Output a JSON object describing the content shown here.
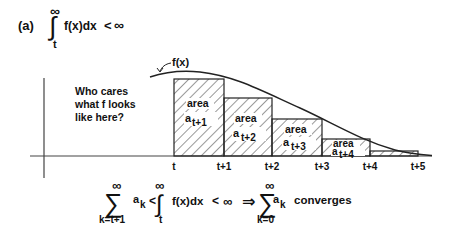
{
  "header": {
    "part_label": "(a)",
    "integral_upper": "∞",
    "integral_lower": "t",
    "integrand": "f(x)dx",
    "relation": "<",
    "bound": "∞"
  },
  "graph": {
    "curve_label": "f(x)",
    "note_lines": [
      "Who cares",
      "what f looks",
      "like here?"
    ],
    "x_ticks": [
      "t",
      "t+1",
      "t+2",
      "t+3",
      "t+4",
      "t+5"
    ],
    "areas": [
      {
        "word": "area",
        "sym": "a",
        "sub": "t+1"
      },
      {
        "word": "area",
        "sym": "a",
        "sub": "t+2"
      },
      {
        "word": "area",
        "sym": "a",
        "sub": "t+3"
      },
      {
        "word": "area",
        "sym": "a",
        "sub": "t+4"
      }
    ]
  },
  "conclusion": {
    "sum1_upper": "∞",
    "sum1_lower": "k=t+1",
    "sum1_term": "a",
    "sum1_term_sub": "k",
    "lt1": "<",
    "int_upper": "∞",
    "int_lower": "t",
    "integrand": "f(x)dx",
    "lt2": "<",
    "bound": "∞",
    "implies": "⇒",
    "sum2_upper": "∞",
    "sum2_lower": "k=0",
    "sum2_term": "a",
    "sum2_term_sub": "k",
    "verdict": "converges"
  }
}
